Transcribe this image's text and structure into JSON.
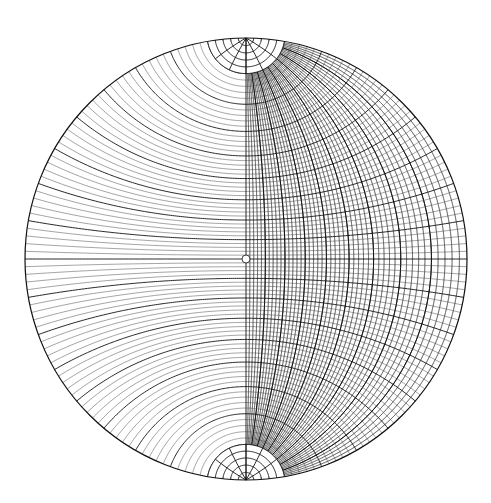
{
  "diagram": {
    "type": "wulff-stereonet",
    "center": [
      246,
      259
    ],
    "radius": 221,
    "grid_interval_deg": 2,
    "major_interval_deg": 10,
    "polar_cap_deg": 10,
    "center_marker_radius": 4,
    "colors": {
      "background": "#ffffff",
      "line": "#333333",
      "major_line": "#111111"
    }
  }
}
